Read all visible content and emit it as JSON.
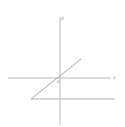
{
  "diagram": {
    "type": "coordinate-axes",
    "axes": {
      "x_label": "x",
      "y_label": "y",
      "origin_label": "0"
    },
    "colors": {
      "axis": "#b8b8b8",
      "line": "#a8a8a8",
      "label": "#888888",
      "background": "#ffffff"
    },
    "elements": [
      {
        "name": "x-axis",
        "from": [
          8,
          78
        ],
        "to": [
          111,
          78
        ]
      },
      {
        "name": "y-axis",
        "from": [
          60,
          17
        ],
        "to": [
          60,
          125
        ]
      },
      {
        "name": "diagonal-line",
        "from": [
          31,
          99
        ],
        "to": [
          81,
          59
        ]
      },
      {
        "name": "horizontal-line",
        "from": [
          31,
          99
        ],
        "to": [
          115,
          99
        ]
      }
    ]
  }
}
